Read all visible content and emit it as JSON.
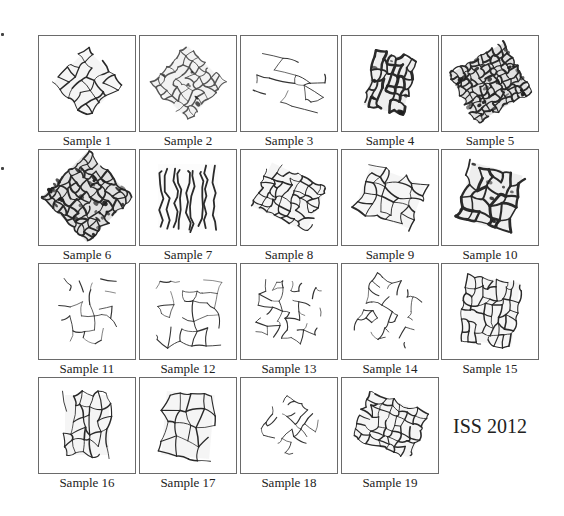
{
  "figure": {
    "samples": [
      {
        "label": "Sample 1",
        "row": 0,
        "col": 0,
        "shape": "diamond",
        "rot": 45,
        "w": 48,
        "h": 48,
        "density": "medium",
        "cells": 5
      },
      {
        "label": "Sample 2",
        "row": 0,
        "col": 1,
        "shape": "diamond",
        "rot": 45,
        "w": 52,
        "h": 52,
        "density": "light",
        "cells": 7
      },
      {
        "label": "Sample 3",
        "row": 0,
        "col": 2,
        "shape": "rect",
        "rot": 20,
        "w": 64,
        "h": 40,
        "density": "sparse",
        "cells": 4
      },
      {
        "label": "Sample 4",
        "row": 0,
        "col": 3,
        "shape": "rect",
        "rot": 15,
        "w": 40,
        "h": 56,
        "density": "dark",
        "cells": 6
      },
      {
        "label": "Sample 5",
        "row": 0,
        "col": 4,
        "shape": "rect",
        "rot": -30,
        "w": 62,
        "h": 56,
        "density": "dense",
        "cells": 10
      },
      {
        "label": "Sample 6",
        "row": 1,
        "col": 0,
        "shape": "diamond",
        "rot": 45,
        "w": 64,
        "h": 64,
        "density": "dense",
        "cells": 9
      },
      {
        "label": "Sample 7",
        "row": 1,
        "col": 1,
        "shape": "rect",
        "rot": 0,
        "w": 60,
        "h": 66,
        "density": "streaks",
        "cells": 6
      },
      {
        "label": "Sample 8",
        "row": 1,
        "col": 2,
        "shape": "rect",
        "rot": 25,
        "w": 60,
        "h": 48,
        "density": "medium",
        "cells": 7
      },
      {
        "label": "Sample 9",
        "row": 1,
        "col": 3,
        "shape": "rect",
        "rot": 20,
        "w": 58,
        "h": 46,
        "density": "medium",
        "cells": 5
      },
      {
        "label": "Sample 10",
        "row": 1,
        "col": 4,
        "shape": "rect",
        "rot": 15,
        "w": 52,
        "h": 58,
        "density": "dark",
        "cells": 5
      },
      {
        "label": "Sample 11",
        "row": 2,
        "col": 0,
        "shape": "rect",
        "rot": 0,
        "w": 52,
        "h": 58,
        "density": "sparse",
        "cells": 5
      },
      {
        "label": "Sample 12",
        "row": 2,
        "col": 1,
        "shape": "rect",
        "rot": 0,
        "w": 60,
        "h": 66,
        "density": "sparse",
        "cells": 5
      },
      {
        "label": "Sample 13",
        "row": 2,
        "col": 2,
        "shape": "rect",
        "rot": 10,
        "w": 58,
        "h": 56,
        "density": "sparse",
        "cells": 6
      },
      {
        "label": "Sample 14",
        "row": 2,
        "col": 3,
        "shape": "rect",
        "rot": 25,
        "w": 54,
        "h": 58,
        "density": "sparse",
        "cells": 6
      },
      {
        "label": "Sample 15",
        "row": 2,
        "col": 4,
        "shape": "rect",
        "rot": 8,
        "w": 52,
        "h": 64,
        "density": "medium",
        "cells": 7
      },
      {
        "label": "Sample 16",
        "row": 3,
        "col": 0,
        "shape": "rect",
        "rot": 0,
        "w": 44,
        "h": 60,
        "density": "medium",
        "cells": 5
      },
      {
        "label": "Sample 17",
        "row": 3,
        "col": 1,
        "shape": "rect",
        "rot": 5,
        "w": 48,
        "h": 64,
        "density": "medium",
        "cells": 4
      },
      {
        "label": "Sample 18",
        "row": 3,
        "col": 2,
        "shape": "diamond",
        "rot": 40,
        "w": 44,
        "h": 44,
        "density": "sparse",
        "cells": 5
      },
      {
        "label": "Sample 19",
        "row": 3,
        "col": 3,
        "shape": "rect",
        "rot": 20,
        "w": 62,
        "h": 48,
        "density": "medium",
        "cells": 7
      }
    ],
    "tag": "ISS 2012"
  }
}
